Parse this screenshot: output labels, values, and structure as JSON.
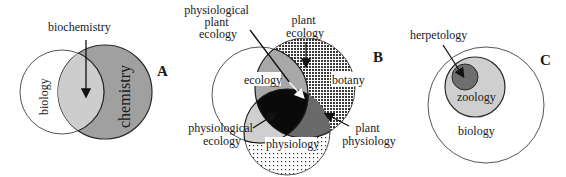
{
  "panels": {
    "A": {
      "letter": "A",
      "labels": {
        "biology": "biology",
        "chemistry": "chemistry",
        "biochemistry": "biochemistry"
      }
    },
    "B": {
      "letter": "B",
      "labels": {
        "ecology": "ecology",
        "botany": "botany",
        "physiology": "physiology",
        "plant_ecology": [
          "plant",
          "ecology"
        ],
        "physiological_plant_ecology": [
          "physiological",
          "plant",
          "ecology"
        ],
        "physiological_ecology": [
          "physiological",
          "ecology"
        ],
        "plant_physiology": [
          "plant",
          "physiology"
        ]
      }
    },
    "C": {
      "letter": "C",
      "labels": {
        "herpetology": "herpetology",
        "zoology": "zoology",
        "biology": "biology"
      }
    }
  },
  "colors": {
    "light_gray": "#cfcfcf",
    "mid_gray": "#9a9a9a",
    "dark_gray": "#6e6e6e",
    "black": "#0a0a0a",
    "outline": "#2a2a2a"
  }
}
